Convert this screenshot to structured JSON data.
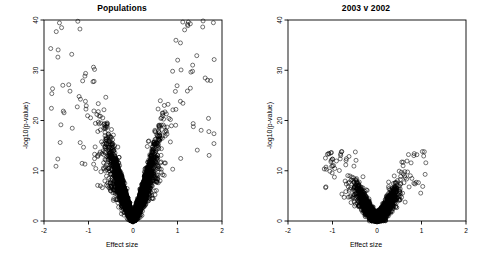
{
  "figure": {
    "width": 488,
    "height": 259,
    "background": "#ffffff",
    "point_color": "#000000",
    "axis_color": "#000000"
  },
  "chart_data": [
    {
      "type": "scatter",
      "title": "Populations",
      "xlabel": "Effect size",
      "ylabel": "-log10(p-value)",
      "xlim": [
        -2,
        2
      ],
      "ylim": [
        0,
        40
      ],
      "xticks": [
        -2,
        -1,
        0,
        1,
        2
      ],
      "xticklabels": [
        "-2",
        "-1",
        "0",
        "1",
        "2"
      ],
      "yticks": [
        0,
        10,
        20,
        30,
        40
      ],
      "yticklabels": [
        "0",
        "10",
        "20",
        "30",
        "40"
      ],
      "grid": false,
      "legend": "none",
      "marker": "open-circle",
      "marker_size": 2.0,
      "n_points": 3400,
      "distribution": {
        "shape": "volcano-v",
        "core_effect_sd": 0.26,
        "core_max_y": 22,
        "slope": 33.0,
        "gap_half_width": 0.035,
        "outlier_fraction": 0.055,
        "outlier_effect_max": 1.85,
        "outlier_y_max": 40,
        "seed": 20031
      },
      "annotations": [
        {
          "text": "dense V-shaped core centred on effect size 0",
          "x": 0,
          "y": 6
        },
        {
          "text": "sparse high-significance outliers up to -log10(p)=40",
          "x": -0.6,
          "y": 39.5
        }
      ]
    },
    {
      "type": "scatter",
      "title": "2003 v 2002",
      "xlabel": "Effect size",
      "ylabel": "-log10(p-value)",
      "xlim": [
        -2,
        2
      ],
      "ylim": [
        0,
        40
      ],
      "xticks": [
        -2,
        -1,
        0,
        1,
        2
      ],
      "xticklabels": [
        "-2",
        "-1",
        "0",
        "1",
        "2"
      ],
      "yticks": [
        0,
        10,
        20,
        30,
        40
      ],
      "yticklabels": [
        "0",
        "10",
        "20",
        "30",
        "40"
      ],
      "grid": false,
      "legend": "none",
      "marker": "open-circle",
      "marker_size": 2.0,
      "n_points": 2600,
      "distribution": {
        "shape": "volcano-v",
        "core_effect_sd": 0.2,
        "core_max_y": 10,
        "slope": 17.0,
        "gap_half_width": 0.03,
        "outlier_fraction": 0.05,
        "outlier_effect_max": 1.2,
        "outlier_y_max": 14,
        "seed": 20022
      },
      "annotations": [
        {
          "text": "narrower, lower-amplitude V confined below -log10(p)=14",
          "x": 0,
          "y": 4
        }
      ]
    }
  ]
}
